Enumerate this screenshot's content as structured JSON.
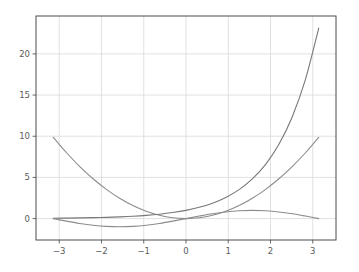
{
  "chart_data": {
    "type": "line",
    "title": "",
    "xlabel": "",
    "ylabel": "",
    "xlim": [
      -3.55,
      3.55
    ],
    "ylim": [
      -2.6,
      24.6
    ],
    "grid": true,
    "legend": "none",
    "background": "#ffffff",
    "frame_color": "#4d4d4d",
    "grid_color": "#d9d9d9",
    "tick_color": "#5a5a5a",
    "x_ticks": [
      -3,
      -2,
      -1,
      0,
      1,
      2,
      3
    ],
    "x_tick_labels": [
      "−3",
      "−2",
      "−1",
      "0",
      "1",
      "2",
      "3"
    ],
    "y_ticks": [
      0,
      5,
      10,
      15,
      20
    ],
    "y_tick_labels": [
      "0",
      "5",
      "10",
      "15",
      "20"
    ],
    "x_domain_start": -3.14159265,
    "x_domain_end": 3.14159265,
    "series": [
      {
        "name": "x squared",
        "expression": "x^2",
        "color": "#8c8c8c",
        "linewidth": 1.1,
        "x": [
          -3.1416,
          -2.8274,
          -2.5133,
          -2.1991,
          -1.885,
          -1.5708,
          -1.2566,
          -0.9425,
          -0.6283,
          -0.3142,
          0.0,
          0.3142,
          0.6283,
          0.9425,
          1.2566,
          1.5708,
          1.885,
          2.1991,
          2.5133,
          2.8274,
          3.1416
        ],
        "y": [
          9.8696,
          7.9942,
          6.3165,
          4.8363,
          3.5531,
          2.4674,
          1.5791,
          0.8884,
          0.3948,
          0.0987,
          0.0,
          0.0987,
          0.3948,
          0.8884,
          1.5791,
          2.4674,
          3.5531,
          4.8363,
          6.3165,
          7.9942,
          9.8696
        ]
      },
      {
        "name": "exponential",
        "expression": "e^x",
        "color": "#787878",
        "linewidth": 1.1,
        "x": [
          -3.1416,
          -2.8274,
          -2.5133,
          -2.1991,
          -1.885,
          -1.5708,
          -1.2566,
          -0.9425,
          -0.6283,
          -0.3142,
          0.0,
          0.3142,
          0.6283,
          0.9425,
          1.2566,
          1.5708,
          1.885,
          2.1991,
          2.5133,
          2.8274,
          3.1416
        ],
        "y": [
          0.0432,
          0.0591,
          0.081,
          0.1109,
          0.1519,
          0.2079,
          0.2846,
          0.3897,
          0.5335,
          0.7304,
          1.0,
          1.3691,
          1.8745,
          2.5663,
          3.5136,
          4.8105,
          6.5861,
          9.0172,
          12.3452,
          16.9013,
          23.1407
        ]
      },
      {
        "name": "sine",
        "expression": "sin(x)",
        "color": "#8c8c8c",
        "linewidth": 1.1,
        "x": [
          -3.1416,
          -2.8274,
          -2.5133,
          -2.1991,
          -1.885,
          -1.5708,
          -1.2566,
          -0.9425,
          -0.6283,
          -0.3142,
          0.0,
          0.3142,
          0.6283,
          0.9425,
          1.2566,
          1.5708,
          1.885,
          2.1991,
          2.5133,
          2.8274,
          3.1416
        ],
        "y": [
          0.0,
          -0.309,
          -0.5878,
          -0.809,
          -0.9511,
          -1.0,
          -0.9511,
          -0.809,
          -0.5878,
          -0.309,
          0.0,
          0.309,
          0.5878,
          0.809,
          0.9511,
          1.0,
          0.9511,
          0.809,
          0.5878,
          0.309,
          0.0
        ]
      }
    ]
  },
  "figure": {
    "plot_left": 36,
    "plot_top": 16,
    "plot_right": 336,
    "plot_bottom": 240
  }
}
